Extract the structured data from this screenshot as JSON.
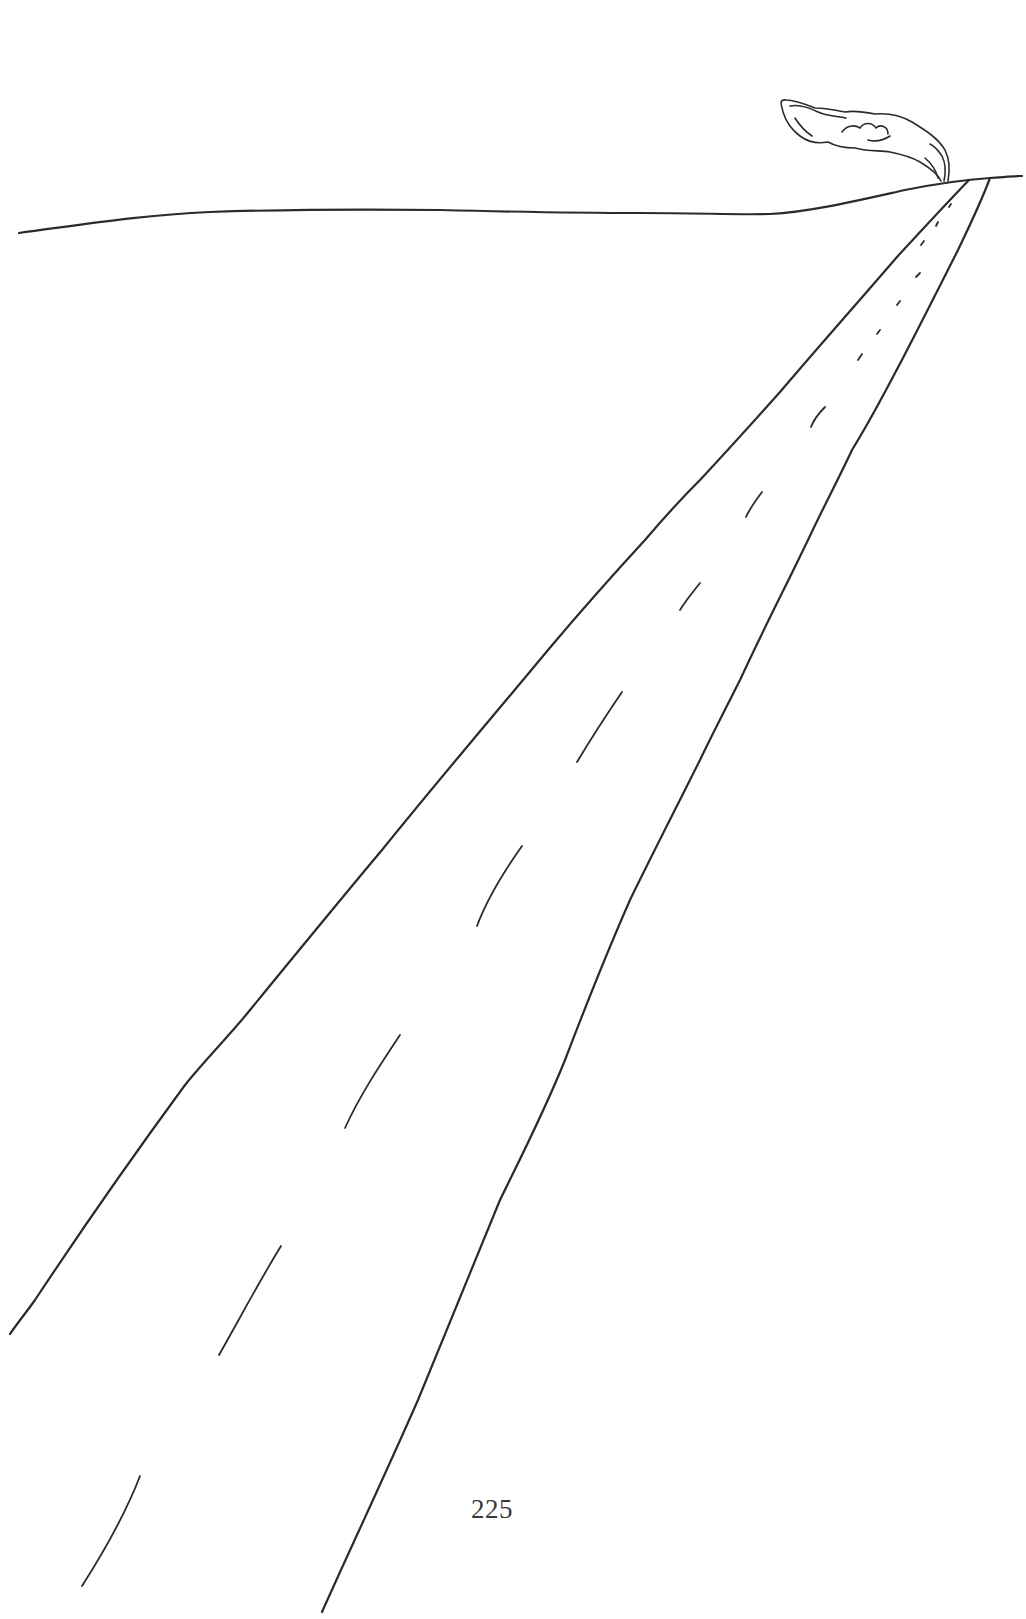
{
  "page": {
    "type": "book-page-illustration",
    "page_number": "225",
    "background_color": "#ffffff",
    "ink_color": "#2b2b2b"
  },
  "illustration": {
    "subject": "line drawing of a long road receding to the horizon with a puff of smoke/dust at the vanishing point",
    "elements": [
      {
        "name": "horizon-line",
        "description": "gently undulating horizon line across the page"
      },
      {
        "name": "road-left-edge",
        "description": "left edge of road from bottom-left to vanishing point"
      },
      {
        "name": "road-right-edge",
        "description": "right edge of road from bottom-center to vanishing point"
      },
      {
        "name": "road-center-dashes",
        "description": "dashed center line shrinking in perspective",
        "count": 13
      },
      {
        "name": "smoke-plume",
        "description": "wispy cloud of smoke rising at the end of the road"
      }
    ]
  }
}
